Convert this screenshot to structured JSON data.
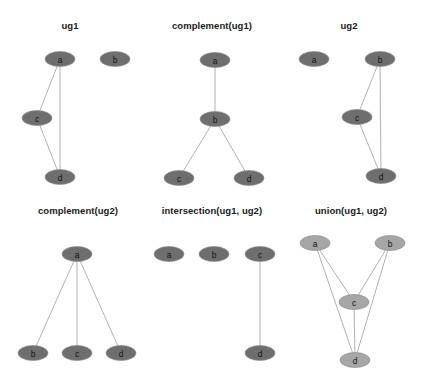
{
  "figure": {
    "width": 423,
    "height": 385,
    "background_color": "#ffffff",
    "rows": 2,
    "cols": 3,
    "node_fill_default": "#6e6e6e",
    "node_fill_light": "#a6a6a6",
    "node_stroke": "#8e8e8e",
    "edge_color": "#a8a8a8",
    "label_color": "#141414",
    "title_color": "#1a1a1a"
  },
  "panels": [
    {
      "id": "ug1",
      "title": "ug1",
      "title_x": 70,
      "title_y": 29,
      "node_fill": "#6e6e6e",
      "nodes": [
        {
          "id": "a",
          "label": "a",
          "cx": 60,
          "cy": 59,
          "rx": 15,
          "ry": 7.5
        },
        {
          "id": "b",
          "label": "b",
          "cx": 115,
          "cy": 59,
          "rx": 15,
          "ry": 7.5
        },
        {
          "id": "c",
          "label": "c",
          "cx": 37,
          "cy": 118,
          "rx": 15,
          "ry": 7.5
        },
        {
          "id": "d",
          "label": "d",
          "cx": 60,
          "cy": 177,
          "rx": 15,
          "ry": 7.5
        }
      ],
      "edges": [
        {
          "from": "a",
          "to": "c"
        },
        {
          "from": "a",
          "to": "d"
        },
        {
          "from": "c",
          "to": "d"
        }
      ]
    },
    {
      "id": "complement_ug1",
      "title": "complement(ug1)",
      "title_x": 212,
      "title_y": 29,
      "node_fill": "#6e6e6e",
      "nodes": [
        {
          "id": "a",
          "label": "a",
          "cx": 215,
          "cy": 60,
          "rx": 15,
          "ry": 7.5
        },
        {
          "id": "b",
          "label": "b",
          "cx": 215,
          "cy": 119,
          "rx": 15,
          "ry": 7.5
        },
        {
          "id": "c",
          "label": "c",
          "cx": 179,
          "cy": 178,
          "rx": 15,
          "ry": 7.5
        },
        {
          "id": "d",
          "label": "d",
          "cx": 249,
          "cy": 178,
          "rx": 15,
          "ry": 7.5
        }
      ],
      "edges": [
        {
          "from": "a",
          "to": "b"
        },
        {
          "from": "b",
          "to": "c"
        },
        {
          "from": "b",
          "to": "d"
        }
      ]
    },
    {
      "id": "ug2",
      "title": "ug2",
      "title_x": 349,
      "title_y": 29,
      "node_fill": "#6e6e6e",
      "nodes": [
        {
          "id": "a",
          "label": "a",
          "cx": 314,
          "cy": 59,
          "rx": 15,
          "ry": 7.5
        },
        {
          "id": "b",
          "label": "b",
          "cx": 380,
          "cy": 59,
          "rx": 15,
          "ry": 7.5
        },
        {
          "id": "c",
          "label": "c",
          "cx": 357,
          "cy": 117,
          "rx": 15,
          "ry": 7.5
        },
        {
          "id": "d",
          "label": "d",
          "cx": 381,
          "cy": 176,
          "rx": 15,
          "ry": 7.5
        }
      ],
      "edges": [
        {
          "from": "b",
          "to": "c"
        },
        {
          "from": "b",
          "to": "d"
        },
        {
          "from": "c",
          "to": "d"
        }
      ]
    },
    {
      "id": "complement_ug2",
      "title": "complement(ug2)",
      "title_x": 78,
      "title_y": 214,
      "node_fill": "#6e6e6e",
      "nodes": [
        {
          "id": "a",
          "label": "a",
          "cx": 77,
          "cy": 254,
          "rx": 15,
          "ry": 7.5
        },
        {
          "id": "b",
          "label": "b",
          "cx": 33,
          "cy": 353,
          "rx": 15,
          "ry": 7.5
        },
        {
          "id": "c",
          "label": "c",
          "cx": 77,
          "cy": 353,
          "rx": 15,
          "ry": 7.5
        },
        {
          "id": "d",
          "label": "d",
          "cx": 121,
          "cy": 353,
          "rx": 15,
          "ry": 7.5
        }
      ],
      "edges": [
        {
          "from": "a",
          "to": "b"
        },
        {
          "from": "a",
          "to": "c"
        },
        {
          "from": "a",
          "to": "d"
        }
      ]
    },
    {
      "id": "intersection_ug1_ug2",
      "title": "intersection(ug1, ug2)",
      "title_x": 212,
      "title_y": 214,
      "node_fill": "#6e6e6e",
      "nodes": [
        {
          "id": "a",
          "label": "a",
          "cx": 169,
          "cy": 254,
          "rx": 15,
          "ry": 7.5
        },
        {
          "id": "b",
          "label": "b",
          "cx": 214,
          "cy": 254,
          "rx": 15,
          "ry": 7.5
        },
        {
          "id": "c",
          "label": "c",
          "cx": 260,
          "cy": 254,
          "rx": 15,
          "ry": 7.5
        },
        {
          "id": "d",
          "label": "d",
          "cx": 260,
          "cy": 353,
          "rx": 15,
          "ry": 7.5
        }
      ],
      "edges": [
        {
          "from": "c",
          "to": "d"
        }
      ]
    },
    {
      "id": "union_ug1_ug2",
      "title": "union(ug1, ug2)",
      "title_x": 351,
      "title_y": 214,
      "node_fill": "#a6a6a6",
      "nodes": [
        {
          "id": "a",
          "label": "a",
          "cx": 315,
          "cy": 243,
          "rx": 15,
          "ry": 7.5
        },
        {
          "id": "b",
          "label": "b",
          "cx": 390,
          "cy": 243,
          "rx": 15,
          "ry": 7.5
        },
        {
          "id": "c",
          "label": "c",
          "cx": 354,
          "cy": 302,
          "rx": 15,
          "ry": 7.5
        },
        {
          "id": "d",
          "label": "d",
          "cx": 355,
          "cy": 360,
          "rx": 15,
          "ry": 7.5
        }
      ],
      "edges": [
        {
          "from": "a",
          "to": "c"
        },
        {
          "from": "a",
          "to": "d"
        },
        {
          "from": "b",
          "to": "c"
        },
        {
          "from": "b",
          "to": "d"
        },
        {
          "from": "c",
          "to": "d"
        }
      ]
    }
  ]
}
